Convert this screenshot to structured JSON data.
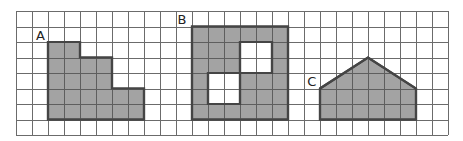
{
  "diagram": {
    "grid": {
      "origin_x": 16,
      "origin_y": 11,
      "cell_w": 16,
      "cell_h": 15.5,
      "cols": 27,
      "rows": 8,
      "line_color": "#6b6b6b"
    },
    "colors": {
      "fill": "#a3a3a3",
      "outline": "#454545",
      "hole": "#ffffff"
    },
    "shapes": [
      {
        "id": "A",
        "label": "A",
        "label_pos": [
          1.25,
          1.85
        ],
        "polygon": [
          [
            2,
            2
          ],
          [
            4,
            2
          ],
          [
            4,
            3
          ],
          [
            6,
            3
          ],
          [
            6,
            5
          ],
          [
            8,
            5
          ],
          [
            8,
            7
          ],
          [
            2,
            7
          ]
        ],
        "holes": []
      },
      {
        "id": "B",
        "label": "B",
        "label_pos": [
          10.1,
          0.85
        ],
        "polygon": [
          [
            11,
            1
          ],
          [
            17,
            1
          ],
          [
            17,
            7
          ],
          [
            11,
            7
          ]
        ],
        "holes": [
          [
            [
              14,
              2
            ],
            [
              16,
              2
            ],
            [
              16,
              4
            ],
            [
              14,
              4
            ]
          ],
          [
            [
              12,
              4
            ],
            [
              14,
              4
            ],
            [
              14,
              6
            ],
            [
              12,
              6
            ]
          ]
        ]
      },
      {
        "id": "C",
        "label": "C",
        "label_pos": [
          18.2,
          4.85
        ],
        "polygon": [
          [
            19,
            5
          ],
          [
            22,
            3
          ],
          [
            25,
            5
          ],
          [
            25,
            7
          ],
          [
            19,
            7
          ]
        ],
        "holes": []
      }
    ]
  }
}
